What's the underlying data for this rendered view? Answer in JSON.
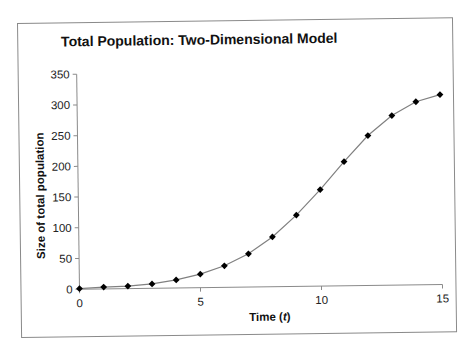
{
  "chart_data": {
    "type": "line",
    "title": "Total Population: Two-Dimensional Model",
    "xlabel": "Time (t)",
    "ylabel": "Size of total population",
    "xlim": [
      0,
      15
    ],
    "ylim": [
      0,
      350
    ],
    "xticks": [
      0,
      5,
      10,
      15
    ],
    "yticks": [
      0,
      50,
      100,
      150,
      200,
      250,
      300,
      350
    ],
    "grid": false,
    "legend": null,
    "marker": "diamond",
    "series": [
      {
        "name": "Total population",
        "x": [
          0,
          1,
          2,
          3,
          4,
          5,
          6,
          7,
          8,
          9,
          10,
          11,
          12,
          13,
          14,
          15
        ],
        "values": [
          1,
          3,
          4,
          7,
          13,
          22,
          35,
          54,
          81,
          116,
          157,
          202,
          244,
          276,
          298,
          309
        ]
      }
    ],
    "colors": {
      "line": "#808080",
      "marker": "#000000",
      "axis": "#8a8a8a"
    }
  }
}
